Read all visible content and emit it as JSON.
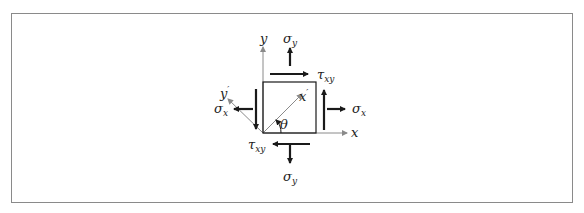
{
  "diagram": {
    "labels": {
      "y_axis": "y",
      "x_axis": "x",
      "y_prime": "y",
      "x_prime": "x",
      "prime": "′",
      "theta": "θ",
      "sigma": "σ",
      "tau": "τ",
      "sub_y": "y",
      "sub_x": "x",
      "sub_xy": "xy"
    },
    "colors": {
      "frame": "#8a8a8a",
      "arrows": "#1a1a1a",
      "axes": "#8a8a8a",
      "text": "#222222"
    }
  }
}
